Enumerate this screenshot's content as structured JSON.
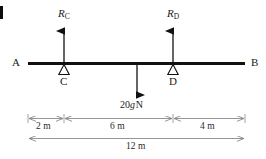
{
  "figure": {
    "colors": {
      "beam": "#111111",
      "arrow": "#111111",
      "dimension_line": "#7b7b7b",
      "support": "#111111",
      "text": "#1a1a1a",
      "background": "#ffffff"
    },
    "beam": {
      "label_left": "A",
      "label_right": "B"
    },
    "supports": [
      {
        "id": "C",
        "label": "C",
        "reaction_label": "R",
        "reaction_subscript": "C"
      },
      {
        "id": "D",
        "label": "D",
        "reaction_label": "R",
        "reaction_subscript": "D"
      }
    ],
    "load": {
      "magnitude": "20",
      "symbol": "g",
      "unit": "N",
      "full_label": "20g N",
      "direction": "down"
    },
    "dimensions": [
      {
        "id": "a-to-c",
        "label": "2 m",
        "value": 2,
        "unit": "m"
      },
      {
        "id": "c-to-d",
        "label": "6 m",
        "value": 6,
        "unit": "m"
      },
      {
        "id": "d-to-b",
        "label": "4 m",
        "value": 4,
        "unit": "m"
      },
      {
        "id": "a-to-b",
        "label": "12 m",
        "value": 12,
        "unit": "m"
      }
    ]
  }
}
